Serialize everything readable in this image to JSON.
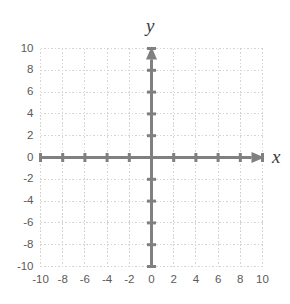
{
  "figure": {
    "title": "",
    "background_color": "#ffffff",
    "width": 290,
    "height": 304
  },
  "axis_labels": {
    "x_name": "x",
    "y_name": "y"
  },
  "colors": {
    "axis": "#808080",
    "grid": "#d4d4d4",
    "tick_text": "#5a5a5a",
    "axis_name_text": "#3a3a3a",
    "background": "#ffffff"
  },
  "chart_data": {
    "type": "scatter",
    "title": "",
    "xlabel": "x",
    "ylabel": "y",
    "xlim": [
      -10,
      10
    ],
    "ylim": [
      -10,
      10
    ],
    "x_ticks": [
      -10,
      -8,
      -6,
      -4,
      -2,
      0,
      2,
      4,
      6,
      8,
      10
    ],
    "y_ticks": [
      -10,
      -8,
      -6,
      -4,
      -2,
      0,
      2,
      4,
      6,
      8,
      10
    ],
    "x_tick_labels": [
      "-10",
      "-8",
      "-6",
      "-4",
      "-2",
      "0",
      "2",
      "4",
      "6",
      "8",
      "10"
    ],
    "y_tick_labels": [
      "10",
      "8",
      "6",
      "4",
      "2",
      "0",
      "-2",
      "-4",
      "-6",
      "-8",
      "-10"
    ],
    "grid": true,
    "grid_style": "dotted",
    "grid_spacing": 2,
    "legend": null,
    "series": [],
    "annotations": [],
    "axis_arrows": {
      "x_positive": true,
      "x_negative": false,
      "y_positive": true,
      "y_negative": false
    }
  }
}
